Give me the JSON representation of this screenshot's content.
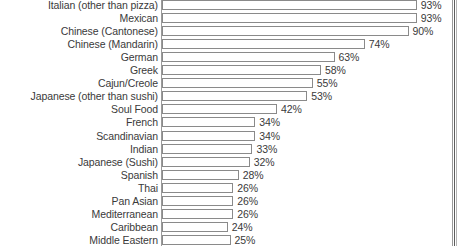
{
  "chart_data": {
    "type": "bar",
    "orientation": "horizontal",
    "title": "",
    "xlabel": "",
    "ylabel": "",
    "xlim": [
      0,
      100
    ],
    "grid": false,
    "legend": null,
    "value_suffix": "%",
    "categories": [
      "Italian (other than pizza)",
      "Mexican",
      "Chinese (Cantonese)",
      "Chinese (Mandarin)",
      "German",
      "Greek",
      "Cajun/Creole",
      "Japanese (other than sushi)",
      "Soul Food",
      "French",
      "Scandinavian",
      "Indian",
      "Japanese (Sushi)",
      "Spanish",
      "Thai",
      "Pan Asian",
      "Mediterranean",
      "Caribbean",
      "Middle Eastern"
    ],
    "values": [
      93,
      93,
      90,
      74,
      63,
      58,
      55,
      53,
      42,
      34,
      34,
      33,
      32,
      28,
      26,
      26,
      26,
      24,
      25
    ],
    "value_labels": [
      "93%",
      "93%",
      "90%",
      "74%",
      "63%",
      "58%",
      "55%",
      "53%",
      "42%",
      "34%",
      "34%",
      "33%",
      "32%",
      "28%",
      "26%",
      "26%",
      "26%",
      "24%",
      "25%"
    ]
  },
  "style": {
    "bar_fill": "#ffffff",
    "bar_border": "#8a8a8a",
    "text_color": "#3a3a3a",
    "background": "#ffffff"
  }
}
